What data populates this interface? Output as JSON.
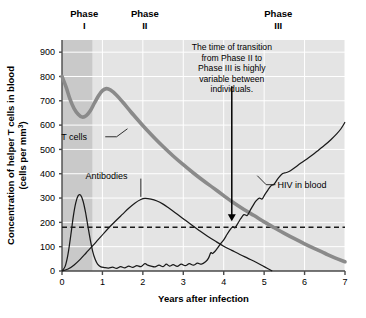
{
  "chart_data": {
    "type": "line",
    "title": "",
    "xlabel": "Years after infection",
    "ylabel": "Concentration of helper T cells in blood",
    "ylabel_sub": "(cells per mm",
    "ylabel_sup": "3",
    "ylabel_end": ")",
    "xlim": [
      0,
      7
    ],
    "ylim": [
      0,
      950
    ],
    "xticks": [
      "0",
      "1",
      "2",
      "3",
      "4",
      "5",
      "6",
      "7"
    ],
    "xtick_values": [
      0,
      1,
      2,
      3,
      4,
      5,
      6,
      7
    ],
    "yticks": [
      "0",
      "100",
      "200",
      "300",
      "400",
      "500",
      "600",
      "700",
      "800",
      "900"
    ],
    "ytick_values": [
      0,
      100,
      200,
      300,
      400,
      500,
      600,
      700,
      800,
      900
    ],
    "grid": true,
    "legend_position": "inline-labels",
    "background_color": "#e4e4e4",
    "phase1_shade_color": "#c9c9c9",
    "phase1_x_range": [
      0,
      0.75
    ],
    "threshold": {
      "label": "",
      "value": 180,
      "style": "dashed",
      "color": "#1a1a1a"
    },
    "series": [
      {
        "name": "T cells",
        "color": "#8a8a8a",
        "width": 3.6,
        "label_x": 0.62,
        "label_y": 552,
        "leader": [
          [
            1.07,
            552
          ],
          [
            1.35,
            552
          ],
          [
            1.62,
            585
          ]
        ],
        "points": [
          [
            0.0,
            800
          ],
          [
            0.1,
            757
          ],
          [
            0.2,
            706
          ],
          [
            0.3,
            668
          ],
          [
            0.4,
            645
          ],
          [
            0.5,
            633
          ],
          [
            0.6,
            639
          ],
          [
            0.7,
            659
          ],
          [
            0.8,
            690
          ],
          [
            0.9,
            720
          ],
          [
            1.0,
            742
          ],
          [
            1.1,
            750
          ],
          [
            1.2,
            744
          ],
          [
            1.35,
            723
          ],
          [
            1.5,
            695
          ],
          [
            1.7,
            655
          ],
          [
            1.9,
            617
          ],
          [
            2.1,
            580
          ],
          [
            2.3,
            545
          ],
          [
            2.5,
            512
          ],
          [
            2.75,
            473
          ],
          [
            3.0,
            437
          ],
          [
            3.25,
            403
          ],
          [
            3.5,
            371
          ],
          [
            3.75,
            341
          ],
          [
            4.0,
            310
          ],
          [
            4.2,
            286
          ],
          [
            4.5,
            253
          ],
          [
            4.75,
            228
          ],
          [
            5.0,
            202
          ],
          [
            5.25,
            178
          ],
          [
            5.5,
            155
          ],
          [
            5.75,
            133
          ],
          [
            6.0,
            112
          ],
          [
            6.25,
            92
          ],
          [
            6.5,
            73
          ],
          [
            6.75,
            54
          ],
          [
            7.0,
            38
          ]
        ]
      },
      {
        "name": "Antibodies",
        "color": "#1a1a1a",
        "width": 1.25,
        "label_x": 1.62,
        "label_y": 392,
        "leader": [
          [
            1.95,
            380
          ],
          [
            1.95,
            305
          ]
        ],
        "points": [
          [
            0.0,
            0
          ],
          [
            0.15,
            8
          ],
          [
            0.3,
            25
          ],
          [
            0.45,
            48
          ],
          [
            0.6,
            75
          ],
          [
            0.75,
            102
          ],
          [
            0.9,
            130
          ],
          [
            1.05,
            158
          ],
          [
            1.2,
            185
          ],
          [
            1.35,
            210
          ],
          [
            1.5,
            234
          ],
          [
            1.65,
            258
          ],
          [
            1.8,
            279
          ],
          [
            1.95,
            294
          ],
          [
            2.05,
            299
          ],
          [
            2.2,
            296
          ],
          [
            2.35,
            288
          ],
          [
            2.5,
            275
          ],
          [
            2.65,
            258
          ],
          [
            2.8,
            240
          ],
          [
            3.0,
            215
          ],
          [
            3.2,
            190
          ],
          [
            3.4,
            166
          ],
          [
            3.6,
            143
          ],
          [
            3.8,
            122
          ],
          [
            4.0,
            102
          ],
          [
            4.2,
            85
          ],
          [
            4.4,
            68
          ],
          [
            4.6,
            52
          ],
          [
            4.8,
            36
          ],
          [
            5.0,
            18
          ],
          [
            5.2,
            0
          ]
        ]
      },
      {
        "name": "HIV in blood",
        "color": "#1a1a1a",
        "width": 1.25,
        "label_x": 5.33,
        "label_y": 355,
        "leader": [
          [
            5.28,
            355
          ],
          [
            5.05,
            355
          ],
          [
            4.83,
            392
          ]
        ],
        "points": [
          [
            0.0,
            0
          ],
          [
            0.08,
            20
          ],
          [
            0.15,
            70
          ],
          [
            0.22,
            150
          ],
          [
            0.28,
            225
          ],
          [
            0.34,
            280
          ],
          [
            0.4,
            310
          ],
          [
            0.46,
            312
          ],
          [
            0.52,
            288
          ],
          [
            0.58,
            243
          ],
          [
            0.64,
            185
          ],
          [
            0.7,
            128
          ],
          [
            0.76,
            80
          ],
          [
            0.82,
            48
          ],
          [
            0.88,
            28
          ],
          [
            0.95,
            18
          ],
          [
            1.05,
            14
          ],
          [
            1.15,
            12
          ],
          [
            1.25,
            16
          ],
          [
            1.35,
            11
          ],
          [
            1.45,
            18
          ],
          [
            1.55,
            13
          ],
          [
            1.65,
            20
          ],
          [
            1.75,
            15
          ],
          [
            1.85,
            22
          ],
          [
            1.95,
            18
          ],
          [
            2.05,
            30
          ],
          [
            2.12,
            24
          ],
          [
            2.2,
            20
          ],
          [
            2.3,
            17
          ],
          [
            2.4,
            24
          ],
          [
            2.5,
            18
          ],
          [
            2.58,
            28
          ],
          [
            2.66,
            20
          ],
          [
            2.75,
            26
          ],
          [
            2.85,
            19
          ],
          [
            2.95,
            28
          ],
          [
            3.05,
            22
          ],
          [
            3.15,
            30
          ],
          [
            3.25,
            24
          ],
          [
            3.35,
            32
          ],
          [
            3.45,
            28
          ],
          [
            3.55,
            38
          ],
          [
            3.62,
            52
          ],
          [
            3.68,
            75
          ],
          [
            3.72,
            72
          ],
          [
            3.78,
            80
          ],
          [
            3.85,
            95
          ],
          [
            3.92,
            112
          ],
          [
            4.0,
            128
          ],
          [
            4.08,
            150
          ],
          [
            4.15,
            168
          ],
          [
            4.22,
            182
          ],
          [
            4.28,
            178
          ],
          [
            4.35,
            196
          ],
          [
            4.42,
            215
          ],
          [
            4.5,
            232
          ],
          [
            4.58,
            228
          ],
          [
            4.65,
            248
          ],
          [
            4.72,
            268
          ],
          [
            4.8,
            288
          ],
          [
            4.88,
            300
          ],
          [
            4.95,
            296
          ],
          [
            5.02,
            315
          ],
          [
            5.1,
            335
          ],
          [
            5.18,
            352
          ],
          [
            5.25,
            358
          ],
          [
            5.35,
            382
          ],
          [
            5.45,
            400
          ],
          [
            5.55,
            405
          ],
          [
            5.65,
            412
          ],
          [
            5.78,
            428
          ],
          [
            5.9,
            443
          ],
          [
            6.05,
            460
          ],
          [
            6.2,
            478
          ],
          [
            6.35,
            498
          ],
          [
            6.5,
            518
          ],
          [
            6.65,
            540
          ],
          [
            6.8,
            565
          ],
          [
            6.9,
            585
          ],
          [
            7.0,
            612
          ]
        ]
      }
    ],
    "annotation": {
      "lines": [
        "The time of transition",
        "from Phase II to",
        "Phase III is highly",
        "variable between",
        "individuals."
      ],
      "arrow_from": [
        4.2,
        760
      ],
      "arrow_to": [
        4.2,
        205
      ]
    },
    "phases": [
      {
        "name": "Phase",
        "numeral": "I",
        "x": 0.55
      },
      {
        "name": "Phase",
        "numeral": "II",
        "x": 2.05
      },
      {
        "name": "Phase",
        "numeral": "III",
        "x": 5.35
      }
    ]
  }
}
